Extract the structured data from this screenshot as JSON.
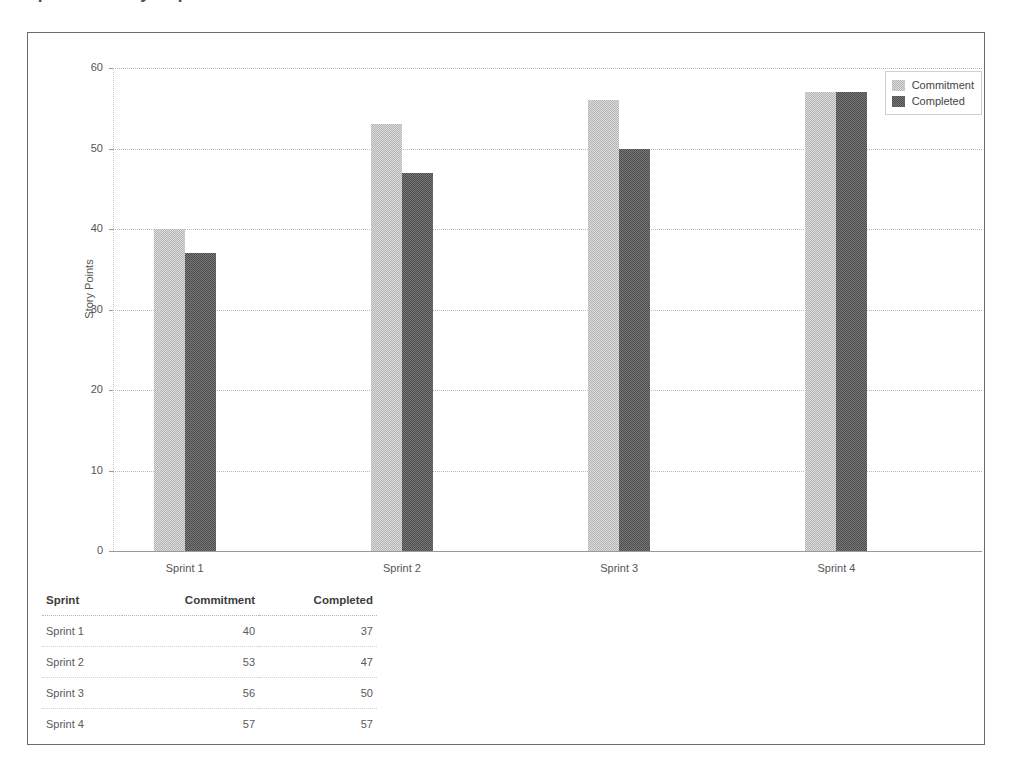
{
  "page": {
    "clipped_title": "Sprint Velocity Report"
  },
  "chart_data": {
    "type": "bar",
    "title": "",
    "xlabel": "",
    "ylabel": "Story Points",
    "ylim": [
      0,
      60
    ],
    "yticks": [
      0,
      10,
      20,
      30,
      40,
      50,
      60
    ],
    "ytick_labels": [
      "0",
      "10",
      "20",
      "30",
      "40",
      "50",
      "60"
    ],
    "grid": true,
    "legend_position": "top-right",
    "categories": [
      "Sprint 1",
      "Sprint 2",
      "Sprint 3",
      "Sprint 4"
    ],
    "series": [
      {
        "name": "Commitment",
        "color": "#b4b4b4",
        "values": [
          40,
          53,
          56,
          57
        ]
      },
      {
        "name": "Completed",
        "color": "#4f4f4f",
        "values": [
          37,
          47,
          50,
          57
        ]
      }
    ]
  },
  "legend": {
    "entries": [
      {
        "label": "Commitment",
        "color": "#b4b4b4"
      },
      {
        "label": "Completed",
        "color": "#4f4f4f"
      }
    ]
  },
  "table": {
    "columns": [
      "Sprint",
      "Commitment",
      "Completed"
    ],
    "rows": [
      {
        "sprint": "Sprint 1",
        "commitment": "40",
        "completed": "37"
      },
      {
        "sprint": "Sprint 2",
        "commitment": "53",
        "completed": "47"
      },
      {
        "sprint": "Sprint 3",
        "commitment": "56",
        "completed": "50"
      },
      {
        "sprint": "Sprint 4",
        "commitment": "57",
        "completed": "57"
      }
    ]
  }
}
